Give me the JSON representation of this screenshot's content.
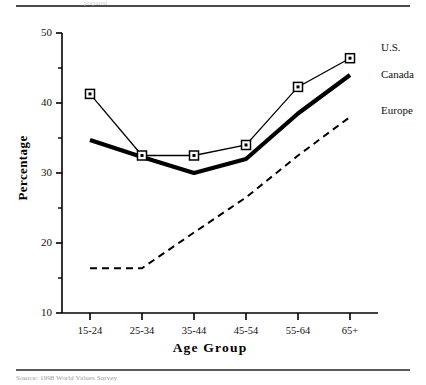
{
  "figure": {
    "header_faint_text": "prepared",
    "source_note": "Source:  1998 World Values Survey"
  },
  "chart_data": {
    "type": "line",
    "title": "",
    "xlabel": "Age Group",
    "ylabel": "Percentage",
    "categories": [
      "15-24",
      "25-34",
      "35-44",
      "45-54",
      "55-64",
      "65+"
    ],
    "ylim": [
      10,
      50
    ],
    "yticks": [
      10,
      20,
      30,
      40,
      50
    ],
    "ytick_labels": [
      "10",
      "20",
      "30",
      "40",
      "50"
    ],
    "yminor_ticks": [
      15,
      25,
      35,
      45
    ],
    "grid": false,
    "legend_position": "right",
    "series": [
      {
        "name": "U.S.",
        "values": [
          41.3,
          32.5,
          32.5,
          34.0,
          42.3,
          46.4
        ],
        "style": "solid-thin-square-markers",
        "color": "#000000"
      },
      {
        "name": "Canada",
        "values": [
          34.7,
          32.3,
          30.0,
          32.0,
          38.5,
          44.0
        ],
        "style": "solid-thick",
        "color": "#000000"
      },
      {
        "name": "Europe",
        "values": [
          16.4,
          16.4,
          21.5,
          26.5,
          32.5,
          38.0
        ],
        "style": "dashed",
        "color": "#000000"
      }
    ]
  }
}
